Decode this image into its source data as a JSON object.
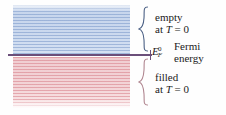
{
  "figure": {
    "type": "energy-band-diagram"
  },
  "bands": {
    "empty": {
      "name": "empty-states-band",
      "color": "#c9d7ee",
      "stripe_color": "#7896c8"
    },
    "filled": {
      "name": "filled-states-band",
      "color": "#f2d1d4",
      "stripe_color": "#d77d87"
    }
  },
  "fermi": {
    "line_color": "#6b4f7a",
    "symbol_base": "E",
    "symbol_sub": "F",
    "symbol_sup": "0",
    "energy_label_line1": "Fermi",
    "energy_label_line2": "energy"
  },
  "labels": {
    "empty_line1": "empty",
    "empty_line2_prefix": "at ",
    "empty_line2_math": "T",
    "empty_line2_suffix": " = 0",
    "filled_line1": "filled",
    "filled_line2_prefix": "at ",
    "filled_line2_math": "T",
    "filled_line2_suffix": " = 0"
  },
  "braces": {
    "empty_color": "#4a5f84",
    "filled_color": "#b08690"
  }
}
